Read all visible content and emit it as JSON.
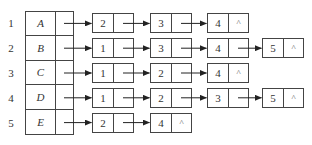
{
  "diagram": {
    "type": "adjacency-list",
    "null_symbol": "^",
    "rows": [
      {
        "index": "1",
        "vertex": "A",
        "adjacent": [
          "2",
          "3",
          "4"
        ]
      },
      {
        "index": "2",
        "vertex": "B",
        "adjacent": [
          "1",
          "3",
          "4",
          "5"
        ]
      },
      {
        "index": "3",
        "vertex": "C",
        "adjacent": [
          "1",
          "2",
          "4"
        ]
      },
      {
        "index": "4",
        "vertex": "D",
        "adjacent": [
          "1",
          "2",
          "3",
          "5"
        ]
      },
      {
        "index": "5",
        "vertex": "E",
        "adjacent": [
          "2",
          "4"
        ]
      }
    ]
  }
}
